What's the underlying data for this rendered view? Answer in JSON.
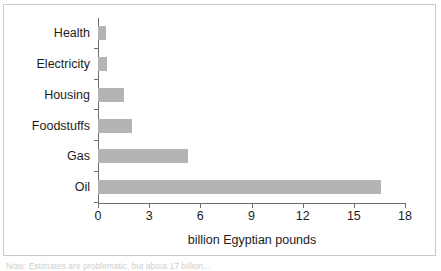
{
  "figure": {
    "note": "Note: Estimates are problematic, but about 17 billion..."
  },
  "chart_data": {
    "type": "bar",
    "orientation": "horizontal",
    "title": "",
    "subtitle": "",
    "xlabel": "billion Egyptian pounds",
    "ylabel": "",
    "categories": [
      "Health",
      "Electricity",
      "Housing",
      "Foodstuffs",
      "Gas",
      "Oil"
    ],
    "values": [
      0.45,
      0.5,
      1.5,
      2.0,
      5.3,
      16.6
    ],
    "series": [
      {
        "name": "Subsidy",
        "values": [
          0.45,
          0.5,
          1.5,
          2.0,
          5.3,
          16.6
        ]
      }
    ],
    "xlim": [
      0,
      18
    ],
    "xticks": [
      0,
      3,
      6,
      9,
      12,
      15,
      18
    ],
    "xtick_labels": [
      "0",
      "3",
      "6",
      "9",
      "12",
      "15",
      "18"
    ],
    "grid": false,
    "legend": "none",
    "bar_color": "#b4b4b4",
    "axis_color": "#6f6f6f",
    "text_color": "#1c1c1c",
    "frame_color": "#c9c9c9"
  }
}
